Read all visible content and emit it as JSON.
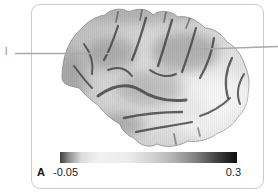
{
  "figure": {
    "panel_label": "A",
    "annotations": {
      "left_label": "l"
    },
    "colorbar": {
      "min_label": "-0.05",
      "max_label": "0.3",
      "gradient_stops": [
        {
          "offset": "0%",
          "color": "#3d3d3d"
        },
        {
          "offset": "5%",
          "color": "#8e8e8e"
        },
        {
          "offset": "12%",
          "color": "#dcdcdc"
        },
        {
          "offset": "22%",
          "color": "#f1f1f1"
        },
        {
          "offset": "38%",
          "color": "#ececec"
        },
        {
          "offset": "52%",
          "color": "#d2d2d2"
        },
        {
          "offset": "64%",
          "color": "#b2b2b2"
        },
        {
          "offset": "76%",
          "color": "#848484"
        },
        {
          "offset": "87%",
          "color": "#4a4a4a"
        },
        {
          "offset": "100%",
          "color": "#0e0e0e"
        }
      ]
    },
    "colors": {
      "panel_border": "#cbcbcb",
      "leader_line": "#a9a9a9",
      "brain_base": "#d9d9d9",
      "sulcus": "#3f3f3f",
      "label_text": "#222222"
    }
  }
}
